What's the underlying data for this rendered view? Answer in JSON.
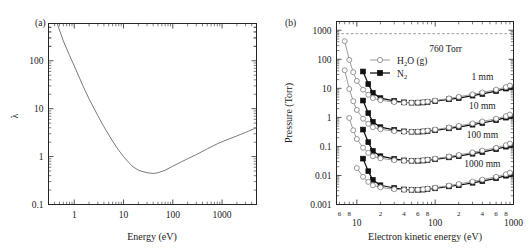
{
  "figure": {
    "panel_a_label": "(a)",
    "panel_b_label": "(b)"
  },
  "chart_data": [
    {
      "type": "line",
      "panel": "(a)",
      "title": "",
      "xlabel": "Energy (eV)",
      "ylabel": "λ",
      "xscale": "log",
      "yscale": "log",
      "xlim": [
        0.3,
        5000
      ],
      "ylim": [
        0.1,
        600
      ],
      "xticks": [
        1,
        10,
        100,
        1000
      ],
      "xtick_labels": [
        "1",
        "10",
        "100",
        "1000"
      ],
      "yticks": [
        0.1,
        1,
        10,
        100
      ],
      "ytick_labels": [
        "0.1",
        "1",
        "10",
        "100"
      ],
      "grid": false,
      "legend": "none",
      "series": [
        {
          "name": "inelastic mean free path",
          "x": [
            0.45,
            0.6,
            0.8,
            1.0,
            1.5,
            2.0,
            3.0,
            4.0,
            6.0,
            8.0,
            10,
            15,
            20,
            30,
            40,
            50,
            70,
            100,
            150,
            200,
            300,
            500,
            800,
            1200,
            2000,
            3000,
            5000
          ],
          "y": [
            600,
            260,
            130,
            78,
            30,
            16,
            7.2,
            4.2,
            2.1,
            1.35,
            1.0,
            0.63,
            0.52,
            0.46,
            0.445,
            0.46,
            0.52,
            0.63,
            0.78,
            0.9,
            1.1,
            1.45,
            1.85,
            2.2,
            2.7,
            3.2,
            4.0
          ]
        }
      ]
    },
    {
      "type": "line",
      "panel": "(b)",
      "title": "",
      "xlabel": "Electron kinetic energy (eV)",
      "ylabel": "Pressure (Torr)",
      "xscale": "log",
      "yscale": "log",
      "xlim": [
        5.5,
        1000
      ],
      "ylim": [
        0.001,
        2000
      ],
      "xticks": [
        10,
        100,
        1000
      ],
      "xtick_labels": [
        "10",
        "100",
        "1000"
      ],
      "xminor_ticks": [
        6,
        8,
        20,
        40,
        60,
        80,
        200,
        400,
        600,
        800
      ],
      "xminor_labels": [
        "6",
        "8",
        "2",
        "4",
        "6",
        "8",
        "2",
        "4",
        "6",
        "8"
      ],
      "yticks": [
        0.001,
        0.01,
        0.1,
        1,
        10,
        100,
        1000
      ],
      "ytick_labels": [
        "0.001",
        "0.01",
        "0.1",
        "1",
        "10",
        "100",
        "1000"
      ],
      "grid": false,
      "legend_position": "upper-center",
      "reference_line": {
        "label": "760 Torr",
        "value": 760,
        "style": "dashed"
      },
      "curve_labels": [
        "1 mm",
        "10 mm",
        "100 mm",
        "1000 mm"
      ],
      "legend_entries": [
        {
          "label": "H₂O (g)",
          "marker": "open-circle",
          "color": "#9a9a9a"
        },
        {
          "label": "N₂",
          "marker": "filled-square",
          "color": "#111111"
        }
      ],
      "series": [
        {
          "name": "N2 1 mm",
          "marker": "filled-square",
          "x": [
            12,
            14,
            16,
            20,
            30,
            40,
            50,
            60,
            70,
            80,
            100,
            150,
            200,
            300,
            400,
            600,
            800,
            900
          ],
          "y": [
            38,
            14,
            7.0,
            4.6,
            3.7,
            3.3,
            3.2,
            3.2,
            3.25,
            3.4,
            3.6,
            4.2,
            4.6,
            5.6,
            6.4,
            8.0,
            9.8,
            10.8
          ]
        },
        {
          "name": "H2O 1 mm",
          "marker": "open-circle",
          "x": [
            7,
            8,
            9,
            10,
            12,
            14,
            16,
            20,
            30,
            40,
            50,
            60,
            70,
            80,
            100,
            150,
            200,
            300,
            400,
            600,
            800,
            900
          ],
          "y": [
            420,
            95,
            36,
            18,
            9.0,
            6.0,
            4.6,
            3.9,
            3.35,
            3.2,
            3.2,
            3.25,
            3.35,
            3.5,
            3.8,
            4.5,
            5.1,
            6.2,
            7.2,
            9.0,
            11.0,
            12.5
          ]
        },
        {
          "name": "N2 10 mm",
          "marker": "filled-square",
          "x": [
            12,
            14,
            16,
            20,
            30,
            40,
            50,
            60,
            70,
            80,
            100,
            150,
            200,
            300,
            400,
            600,
            800,
            900
          ],
          "y": [
            3.8,
            1.4,
            0.7,
            0.46,
            0.37,
            0.33,
            0.32,
            0.32,
            0.325,
            0.34,
            0.36,
            0.42,
            0.46,
            0.56,
            0.64,
            0.8,
            0.98,
            1.08
          ]
        },
        {
          "name": "H2O 10 mm",
          "marker": "open-circle",
          "x": [
            7,
            8,
            9,
            10,
            12,
            14,
            16,
            20,
            30,
            40,
            50,
            60,
            70,
            80,
            100,
            150,
            200,
            300,
            400,
            600,
            800,
            900
          ],
          "y": [
            42,
            9.5,
            3.6,
            1.8,
            0.9,
            0.6,
            0.46,
            0.39,
            0.335,
            0.32,
            0.32,
            0.325,
            0.335,
            0.35,
            0.38,
            0.45,
            0.51,
            0.62,
            0.72,
            0.9,
            1.1,
            1.25
          ]
        },
        {
          "name": "N2 100 mm",
          "marker": "filled-square",
          "x": [
            12,
            14,
            16,
            20,
            30,
            40,
            50,
            60,
            70,
            80,
            100,
            150,
            200,
            300,
            400,
            600,
            800,
            900
          ],
          "y": [
            0.38,
            0.14,
            0.07,
            0.046,
            0.037,
            0.033,
            0.032,
            0.032,
            0.0325,
            0.034,
            0.036,
            0.042,
            0.046,
            0.056,
            0.064,
            0.08,
            0.098,
            0.108
          ]
        },
        {
          "name": "H2O 100 mm",
          "marker": "open-circle",
          "x": [
            8,
            9,
            10,
            12,
            14,
            16,
            20,
            30,
            40,
            50,
            60,
            70,
            80,
            100,
            150,
            200,
            300,
            400,
            600,
            800,
            900
          ],
          "y": [
            0.95,
            0.36,
            0.18,
            0.09,
            0.06,
            0.046,
            0.039,
            0.0335,
            0.032,
            0.032,
            0.0325,
            0.0335,
            0.035,
            0.038,
            0.045,
            0.051,
            0.062,
            0.072,
            0.09,
            0.11,
            0.125
          ]
        },
        {
          "name": "N2 1000 mm",
          "marker": "filled-square",
          "x": [
            12,
            14,
            16,
            20,
            30,
            40,
            50,
            60,
            70,
            80,
            100,
            150,
            200,
            300,
            400,
            600,
            800,
            900
          ],
          "y": [
            0.038,
            0.014,
            0.007,
            0.0046,
            0.0037,
            0.0033,
            0.0032,
            0.0032,
            0.00325,
            0.0034,
            0.0036,
            0.0042,
            0.0046,
            0.0056,
            0.0064,
            0.008,
            0.0098,
            0.0108
          ]
        },
        {
          "name": "H2O 1000 mm",
          "marker": "open-circle",
          "x": [
            10,
            12,
            14,
            16,
            20,
            30,
            40,
            50,
            60,
            70,
            80,
            100,
            150,
            200,
            300,
            400,
            600,
            800,
            900
          ],
          "y": [
            0.018,
            0.009,
            0.006,
            0.0046,
            0.0039,
            0.00335,
            0.0032,
            0.0032,
            0.00325,
            0.00335,
            0.0035,
            0.0038,
            0.0045,
            0.0051,
            0.0062,
            0.0072,
            0.009,
            0.011,
            0.0125
          ]
        }
      ]
    }
  ]
}
